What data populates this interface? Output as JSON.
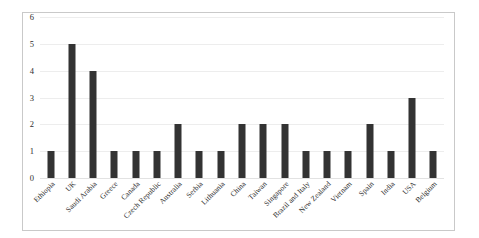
{
  "chart_data": {
    "type": "bar",
    "title": "",
    "subtitle": "",
    "xlabel": "",
    "ylabel": "",
    "ylim": [
      0,
      6
    ],
    "ytick_labels": [
      "6",
      "5",
      "4",
      "3",
      "2",
      "1",
      "0"
    ],
    "yticks": [
      6,
      5,
      4,
      3,
      2,
      1,
      0
    ],
    "grid": true,
    "legend": null,
    "legend_position": "none",
    "bar_color": "#333333",
    "categories": [
      "Ethiopia",
      "UK",
      "Saudi Arabia",
      "Greece",
      "Canada",
      "Czech Republic",
      "Australia",
      "Serbia",
      "Lithuania",
      "China",
      "Taiwan",
      "Singapore",
      "Brazil and Italy",
      "New Zealand",
      "Vietnam",
      "Spain",
      "India",
      "USA",
      "Belgium"
    ],
    "values": [
      1,
      5,
      4,
      1,
      1,
      1,
      2,
      1,
      1,
      2,
      2,
      2,
      1,
      1,
      1,
      2,
      1,
      3,
      1
    ]
  },
  "colors": {
    "bar": "#333333",
    "grid": "#ededed",
    "frame": "#c9c9c9",
    "text": "#2b2b2b",
    "background": "#ffffff"
  }
}
